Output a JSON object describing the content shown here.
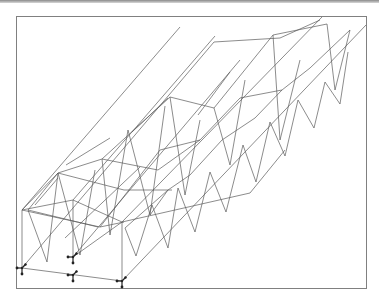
{
  "viewport": {
    "kind": "3D structural wireframe view",
    "frame": {
      "x": 16,
      "y": 16,
      "w": 350,
      "h": 272
    },
    "colors": {
      "background": "#ffffff",
      "frame": "#808080",
      "member": "#5a5a5a",
      "support": "#222222"
    }
  },
  "model": {
    "description": "Twin parallel trusses forming a U-shaped trough/box girder, shown in isometric projection",
    "supports": [
      {
        "name": "support-1",
        "x": 22,
        "y": 268
      },
      {
        "name": "support-2",
        "x": 73,
        "y": 257
      },
      {
        "name": "support-3",
        "x": 73,
        "y": 275
      },
      {
        "name": "support-4",
        "x": 122,
        "y": 281
      }
    ],
    "members": [
      [
        22,
        268,
        122,
        281
      ],
      [
        22,
        268,
        22,
        210
      ],
      [
        73,
        257,
        73,
        200
      ],
      [
        122,
        281,
        122,
        222
      ],
      [
        22,
        210,
        73,
        200
      ],
      [
        73,
        200,
        122,
        222
      ],
      [
        22,
        210,
        180,
        27
      ],
      [
        73,
        200,
        215,
        36
      ],
      [
        22,
        268,
        214,
        42
      ],
      [
        73,
        257,
        240,
        60
      ],
      [
        122,
        281,
        366,
        25
      ],
      [
        122,
        222,
        322,
        17
      ],
      [
        73,
        257,
        122,
        222
      ],
      [
        22,
        210,
        58,
        173
      ],
      [
        58,
        173,
        102,
        159
      ],
      [
        102,
        159,
        170,
        97
      ],
      [
        170,
        97,
        214,
        108
      ],
      [
        214,
        108,
        273,
        35
      ],
      [
        273,
        35,
        327,
        24
      ],
      [
        58,
        173,
        28,
        210
      ],
      [
        28,
        210,
        47,
        262
      ],
      [
        47,
        262,
        58,
        173
      ],
      [
        58,
        173,
        80,
        255
      ],
      [
        80,
        255,
        95,
        170
      ],
      [
        102,
        159,
        110,
        235
      ],
      [
        110,
        235,
        128,
        130
      ],
      [
        128,
        130,
        150,
        215
      ],
      [
        150,
        215,
        165,
        106
      ],
      [
        170,
        97,
        185,
        195
      ],
      [
        185,
        195,
        200,
        120
      ],
      [
        214,
        108,
        230,
        165
      ],
      [
        230,
        165,
        245,
        80
      ],
      [
        273,
        35,
        280,
        140
      ],
      [
        280,
        140,
        300,
        60
      ],
      [
        327,
        24,
        335,
        90
      ],
      [
        335,
        90,
        350,
        30
      ],
      [
        66,
        165,
        110,
        138
      ],
      [
        132,
        132,
        168,
        98
      ],
      [
        198,
        115,
        230,
        72
      ],
      [
        35,
        205,
        58,
        178
      ],
      [
        125,
        228,
        168,
        190
      ],
      [
        168,
        190,
        190,
        175
      ],
      [
        190,
        175,
        222,
        140
      ],
      [
        222,
        140,
        255,
        118
      ],
      [
        255,
        118,
        282,
        90
      ],
      [
        282,
        90,
        310,
        68
      ],
      [
        310,
        68,
        350,
        30
      ],
      [
        125,
        228,
        136,
        256
      ],
      [
        136,
        256,
        152,
        205
      ],
      [
        152,
        205,
        168,
        248
      ],
      [
        168,
        248,
        178,
        188
      ],
      [
        178,
        188,
        195,
        232
      ],
      [
        195,
        232,
        210,
        172
      ],
      [
        210,
        172,
        226,
        212
      ],
      [
        226,
        212,
        243,
        145
      ],
      [
        243,
        145,
        256,
        182
      ],
      [
        256,
        182,
        270,
        122
      ],
      [
        270,
        122,
        285,
        156
      ],
      [
        285,
        156,
        298,
        100
      ],
      [
        298,
        100,
        314,
        128
      ],
      [
        314,
        128,
        325,
        82
      ],
      [
        325,
        82,
        340,
        104
      ],
      [
        340,
        104,
        348,
        52
      ],
      [
        122,
        222,
        250,
        193
      ],
      [
        250,
        193,
        285,
        150
      ],
      [
        100,
        227,
        160,
        150
      ],
      [
        65,
        238,
        140,
        167
      ],
      [
        22,
        210,
        100,
        227
      ],
      [
        100,
        227,
        124,
        222
      ],
      [
        58,
        173,
        124,
        190
      ],
      [
        124,
        190,
        172,
        190
      ],
      [
        28,
        210,
        98,
        227
      ],
      [
        160,
        150,
        200,
        140
      ],
      [
        200,
        140,
        240,
        98
      ],
      [
        240,
        98,
        282,
        90
      ],
      [
        214,
        42,
        280,
        38
      ],
      [
        280,
        38,
        320,
        20
      ],
      [
        102,
        159,
        158,
        170
      ],
      [
        158,
        170,
        200,
        140
      ],
      [
        150,
        215,
        168,
        190
      ]
    ]
  },
  "labels": {
    "top_bar": ""
  }
}
